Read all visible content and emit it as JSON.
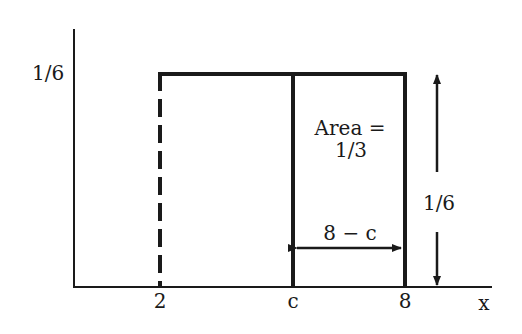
{
  "diagram": {
    "y_tick_label": "1/6",
    "x_ticks": [
      {
        "label": "2"
      },
      {
        "label": "c"
      },
      {
        "label": "8"
      }
    ],
    "x_axis_label": "x",
    "area_label_line1": "Area =",
    "area_label_line2": "1/3",
    "width_label": "8 − c",
    "height_label": "1/6",
    "colors": {
      "ink": "#1a1a1a",
      "background": "#ffffff"
    }
  }
}
